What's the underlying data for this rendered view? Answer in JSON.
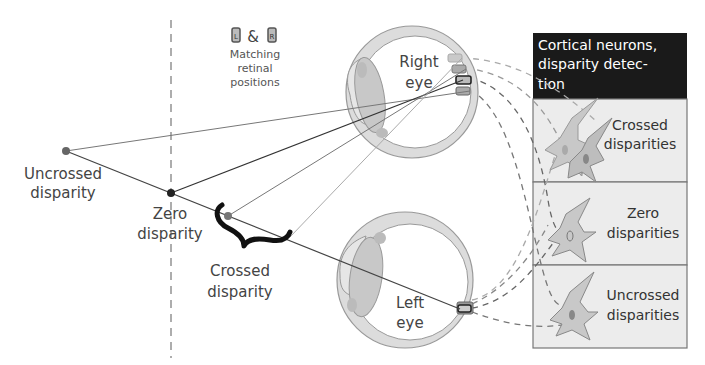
{
  "legend": {
    "left_symbol": "L",
    "ampersand": "&",
    "right_symbol": "R",
    "line1": "Matching",
    "line2": "retinal",
    "line3": "positions"
  },
  "points": {
    "uncrossed": {
      "line1": "Uncrossed",
      "line2": "disparity"
    },
    "zero": {
      "line1": "Zero",
      "line2": "disparity"
    },
    "crossed": {
      "line1": "Crossed",
      "line2": "disparity"
    }
  },
  "eyes": {
    "right": {
      "line1": "Right",
      "line2": "eye"
    },
    "left": {
      "line1": "Left",
      "line2": "eye"
    }
  },
  "cortex": {
    "header": {
      "line1": "Cortical neurons,",
      "line2": "disparity detec-",
      "line3": "tion"
    },
    "rows": [
      {
        "line1": "Crossed",
        "line2": "disparities"
      },
      {
        "line1": "Zero",
        "line2": "disparities"
      },
      {
        "line1": "Uncrossed",
        "line2": "disparities"
      }
    ]
  },
  "colors": {
    "header_bg": "#1a1a1a",
    "panel_bg": "#ececec",
    "eye_fill": "#dcdcdc",
    "lens_fill": "#c8c8c8",
    "neuron_fill": "#bdbdbd",
    "line": "#555555"
  }
}
